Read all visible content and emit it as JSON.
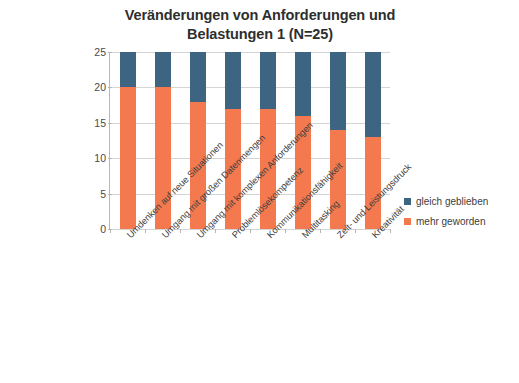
{
  "chart_data": {
    "type": "bar",
    "subtype": "stacked-column",
    "title": "Veränderungen von Anforderungen und Belastungen 1 (N=25)",
    "title_lines": [
      "Veränderungen von Anforderungen und",
      "Belastungen 1 (N=25)"
    ],
    "xlabel": "",
    "ylabel": "",
    "ylim": [
      0,
      25
    ],
    "yticks": [
      0,
      5,
      10,
      15,
      20,
      25
    ],
    "ytick_labels": [
      "0",
      "5",
      "10",
      "15",
      "20",
      "25"
    ],
    "grid": true,
    "grid_axis": "y",
    "legend_position": "right",
    "categories": [
      "Umdenken auf neue Situationen",
      "Umgang mit großen Datenmengen",
      "Umgang mit komplexen Anforderungen",
      "Problemlösekompetenz",
      "Kommunikationsfähigkeit",
      "Multitasking",
      "Zeit- und Leistungsdruck",
      "Kreativität"
    ],
    "series": [
      {
        "name": "mehr geworden",
        "color": "#F4794E",
        "values": [
          20,
          20,
          18,
          17,
          17,
          16,
          14,
          13
        ]
      },
      {
        "name": "gleich geblieben",
        "color": "#3D6582",
        "values": [
          5,
          5,
          7,
          8,
          8,
          9,
          11,
          12
        ]
      }
    ],
    "stack_order": [
      "mehr geworden",
      "gleich geblieben"
    ],
    "totals": [
      25,
      25,
      25,
      25,
      25,
      25,
      25,
      25
    ]
  },
  "legend": {
    "items": [
      {
        "label": "gleich geblieben",
        "color": "#3D6582"
      },
      {
        "label": "mehr geworden",
        "color": "#F4794E"
      }
    ]
  },
  "caption": {
    "text": ""
  },
  "colors": {
    "blue": "#3D6582",
    "orange": "#F4794E",
    "grid": "#d4d4d4",
    "axis": "#b6b6b6",
    "text": "#3f3f3f"
  }
}
